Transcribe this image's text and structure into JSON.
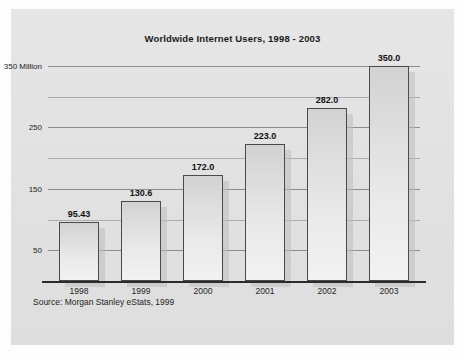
{
  "figure": {
    "background_color": "#ffffff",
    "panel_color": "#e3e3e3",
    "source_note": "Source: Morgan Stanley eStats, 1999"
  },
  "chart_data": {
    "type": "bar",
    "title": "Worldwide Internet Users, 1998 - 2003",
    "xlabel": "",
    "ylabel": "",
    "categories": [
      "1998",
      "1999",
      "2000",
      "2001",
      "2002",
      "2003"
    ],
    "values": [
      95.43,
      130.6,
      172.0,
      223.0,
      282.0,
      350.0
    ],
    "value_labels": [
      "95.43",
      "130.6",
      "172.0",
      "223.0",
      "282.0",
      "350.0"
    ],
    "ylim": [
      0,
      350
    ],
    "yticks": [
      50,
      100,
      150,
      200,
      250,
      300,
      350
    ],
    "ytick_labels": [
      "50",
      "",
      "150",
      "",
      "250",
      "",
      "350 Million"
    ],
    "grid": true,
    "legend": "none",
    "bar_color": "#e9e9e9",
    "bar_border_color": "#4a4a4a",
    "gridline_color": "#8d8d8d",
    "axis_color": "#2b2b2b",
    "units": "Million"
  }
}
